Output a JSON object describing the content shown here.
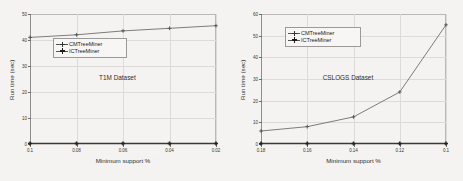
{
  "figure": {
    "background_color": "#f4f3f1",
    "line_color": "#55544f",
    "grid_color": "#dcdbd9",
    "axis_color": "#8e8d8b"
  },
  "chart_data": [
    {
      "type": "line",
      "id": "t1m",
      "title": "T1M Dataset",
      "xlabel": "Minimum support %",
      "ylabel": "Run time (sec)",
      "categories": [
        "0.1",
        "0.08",
        "0.06",
        "0.04",
        "0.02"
      ],
      "x": [
        0.1,
        0.08,
        0.06,
        0.04,
        0.02
      ],
      "xlim": [
        0,
        4
      ],
      "ylim": [
        0,
        50
      ],
      "yticks": [
        0,
        10,
        20,
        30,
        40,
        50
      ],
      "ytick_labels": [
        "0",
        "10",
        "20",
        "30",
        "40",
        "50"
      ],
      "xtick_labels": [
        "0.1",
        "0.08",
        "0.06",
        "0.04",
        "0.02"
      ],
      "grid": true,
      "legend_position": "upper left",
      "series": [
        {
          "name": "CMTreeMiner",
          "marker": "plus",
          "values": [
            41.0,
            42.0,
            43.5,
            44.5,
            45.5
          ]
        },
        {
          "name": "ICTreeMiner",
          "marker": "plus-bold",
          "values": [
            0.2,
            0.2,
            0.2,
            0.2,
            0.2
          ]
        }
      ]
    },
    {
      "type": "line",
      "id": "cslogs",
      "title": "CSLOGS Dataset",
      "xlabel": "Minimum support %",
      "ylabel": "Run time (sec)",
      "categories": [
        "0.18",
        "0.16",
        "0.14",
        "0.12",
        "0.1"
      ],
      "x": [
        0.18,
        0.16,
        0.14,
        0.12,
        0.1
      ],
      "xlim": [
        0,
        4
      ],
      "ylim": [
        0,
        60
      ],
      "yticks": [
        0,
        10,
        20,
        30,
        40,
        50,
        60
      ],
      "ytick_labels": [
        "0",
        "10",
        "20",
        "30",
        "40",
        "50",
        "60"
      ],
      "xtick_labels": [
        "0.18",
        "0.16",
        "0.14",
        "0.12",
        "0.1"
      ],
      "grid": true,
      "legend_position": "upper left",
      "series": [
        {
          "name": "CMTreeMiner",
          "marker": "plus",
          "values": [
            6.0,
            8.0,
            12.5,
            24.0,
            55.0
          ]
        },
        {
          "name": "ICTreeMiner",
          "marker": "plus-bold",
          "values": [
            0.2,
            0.2,
            0.2,
            0.2,
            0.2
          ]
        }
      ]
    }
  ]
}
